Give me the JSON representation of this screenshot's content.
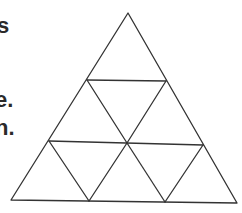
{
  "text_fragments": [
    {
      "text": "s"
    },
    {
      "text": "e."
    },
    {
      "text": "n."
    }
  ],
  "figure": {
    "type": "triangle-subdivision",
    "rows": 3,
    "stroke_color": "#333333",
    "fill_color": "#ffffff",
    "vertices": {
      "apex": [
        128,
        13
      ],
      "bottom_left": [
        11,
        200
      ],
      "bottom_right": [
        237,
        203
      ]
    }
  }
}
